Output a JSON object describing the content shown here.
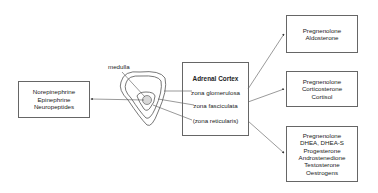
{
  "medulla_label": "medulla",
  "medulla_outputs": [
    "Norepinephrine",
    "Epinephrine",
    "Neuropeptides"
  ],
  "cortex": {
    "title": "Adrenal Cortex",
    "zones": [
      "zona glomerulosa",
      "zona fasciculata",
      "(zona reticularis)"
    ]
  },
  "outputs": [
    {
      "lines": [
        "Pregnenolone",
        "Aldosterone"
      ]
    },
    {
      "lines": [
        "Pregnenolone",
        "Corticosterone",
        "Cortisol"
      ]
    },
    {
      "lines": [
        "Pregnenolone",
        "DHEA, DHEA-S",
        "Progesterone",
        "Androstenedione",
        "Testosterone",
        "Oestrogens"
      ]
    }
  ]
}
